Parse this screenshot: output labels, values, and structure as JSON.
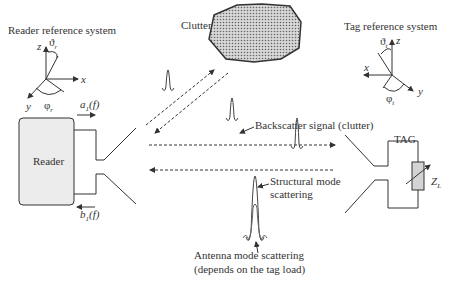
{
  "diagram": {
    "reader_reference": {
      "title": "Reader reference system",
      "axis_z": "z",
      "axis_x": "x",
      "axis_y": "y",
      "theta": "ϑ",
      "theta_sub": "r",
      "phi": "φ",
      "phi_sub": "r"
    },
    "tag_reference": {
      "title": "Tag reference system",
      "axis_z": "z",
      "axis_x": "x",
      "axis_y": "y",
      "theta": "ϑ",
      "theta_sub": "t",
      "phi": "φ",
      "phi_sub": "t"
    },
    "clutter_label": "Clutter",
    "reader_label": "Reader",
    "tag_label": "TAG",
    "load_label": "Z",
    "load_sub": "L",
    "a1_label": "a",
    "a1_sub": "1",
    "a1_arg": "(f)",
    "b1_label": "b",
    "b1_sub": "1",
    "b1_arg": "(f)",
    "backscatter_label": "Backscatter signal (clutter)",
    "structural_label_line1": "Structural mode",
    "structural_label_line2": "scattering",
    "antenna_label_line1": "Antenna mode scattering",
    "antenna_label_line2": "(depends on the tag load)",
    "colors": {
      "line": "#333333",
      "reader_fill": "#ececec",
      "load_fill": "#d4d4d4",
      "clutter_fill": "#b0b0b0"
    }
  }
}
